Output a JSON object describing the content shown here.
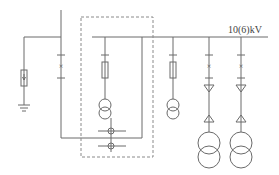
{
  "diagram": {
    "type": "single-line electrical diagram",
    "busbar_label": "10(6)kV",
    "colors": {
      "line": "#6a6a6a",
      "dashed_box": "#8a8a8a",
      "text": "#444444"
    },
    "elements": [
      {
        "id": "incoming-feeder",
        "components": [
          "circuit-breaker"
        ]
      },
      {
        "id": "surge-arrester-branch",
        "components": [
          "surge-arrester",
          "ground"
        ]
      },
      {
        "id": "metering-cabinet",
        "components": [
          "fuse",
          "voltage-transformer",
          "current-transformers"
        ],
        "boundary": "dashed"
      },
      {
        "id": "pt-branch",
        "components": [
          "fuse",
          "voltage-transformer"
        ]
      },
      {
        "id": "outgoing-feeder-1",
        "components": [
          "circuit-breaker",
          "cable-head",
          "cable-head",
          "power-transformer"
        ]
      },
      {
        "id": "outgoing-feeder-2",
        "components": [
          "circuit-breaker",
          "cable-head",
          "cable-head",
          "power-transformer"
        ]
      }
    ]
  }
}
